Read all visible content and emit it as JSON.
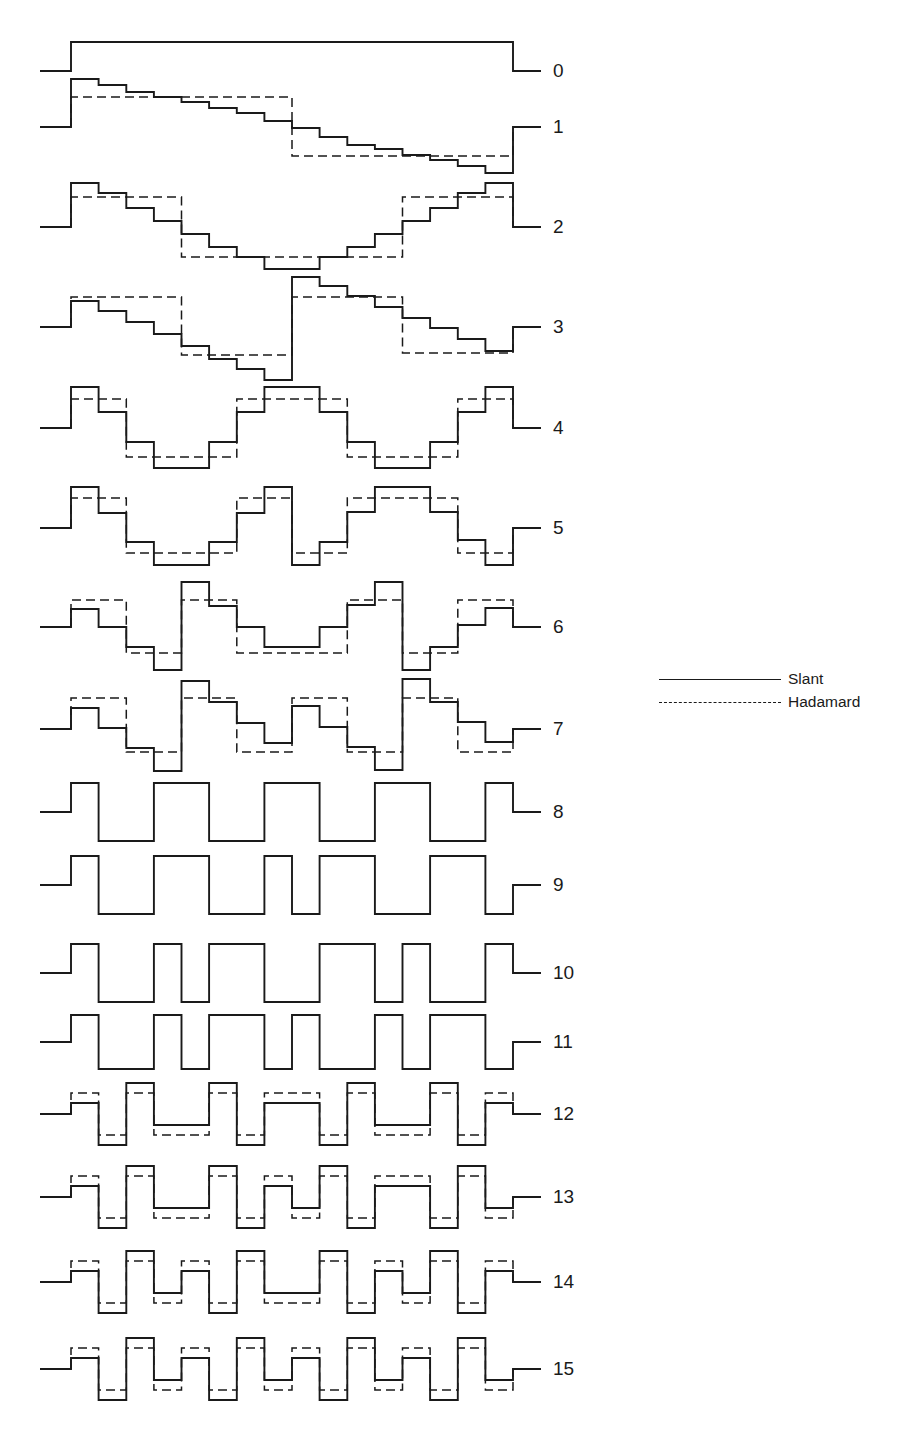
{
  "figure": {
    "x_start": 71,
    "x_end": 513,
    "lead_left_start": 40,
    "lead_right_end": 541,
    "label_x": 553,
    "n_steps": 16
  },
  "legend": {
    "items": [
      {
        "label": "Slant",
        "style": "solid"
      },
      {
        "label": "Hadamard",
        "style": "dashed"
      }
    ]
  },
  "chart_data": {
    "type": "step",
    "title": "",
    "xlabel": "",
    "ylabel": "",
    "legend": [
      "Slant",
      "Hadamard"
    ],
    "legend_position": "right",
    "grid": false,
    "units": "pixel offset above baseline (positive = up)",
    "rows": [
      {
        "label": "0",
        "baseline": 71,
        "slant": [
          29,
          29,
          29,
          29,
          29,
          29,
          29,
          29,
          29,
          29,
          29,
          29,
          29,
          29,
          29,
          29
        ],
        "hadamard": null
      },
      {
        "label": "1",
        "baseline": 127,
        "slant": [
          48,
          42,
          35,
          30,
          25,
          19,
          14,
          6,
          -1,
          -10,
          -18,
          -22,
          -28,
          -33,
          -39,
          -46
        ],
        "hadamard": [
          30,
          30,
          30,
          30,
          30,
          30,
          30,
          30,
          -29,
          -29,
          -29,
          -29,
          -29,
          -29,
          -29,
          -29
        ]
      },
      {
        "label": "2",
        "baseline": 227,
        "slant": [
          44,
          34,
          19,
          6,
          -7,
          -20,
          -30,
          -42,
          -42,
          -30,
          -20,
          -7,
          6,
          19,
          34,
          44
        ],
        "hadamard": [
          30,
          30,
          30,
          30,
          -30,
          -30,
          -30,
          -30,
          -30,
          -30,
          -30,
          -30,
          30,
          30,
          30,
          30
        ]
      },
      {
        "label": "3",
        "baseline": 327,
        "slant": [
          26,
          16,
          5,
          -7,
          -19,
          -32,
          -42,
          -53,
          50,
          41,
          31,
          20,
          9,
          -1,
          -12,
          -24
        ],
        "hadamard": [
          30,
          30,
          30,
          30,
          -28,
          -28,
          -28,
          -28,
          30,
          30,
          30,
          30,
          -26,
          -26,
          -26,
          -26
        ]
      },
      {
        "label": "4",
        "baseline": 428,
        "slant": [
          41,
          16,
          -14,
          -40,
          -40,
          -14,
          16,
          41,
          41,
          16,
          -14,
          -40,
          -40,
          -14,
          16,
          41
        ],
        "hadamard": [
          29,
          29,
          -29,
          -29,
          -29,
          -29,
          29,
          29,
          29,
          29,
          -29,
          -29,
          -29,
          -29,
          29,
          29
        ]
      },
      {
        "label": "5",
        "baseline": 528,
        "slant": [
          41,
          15,
          -14,
          -37,
          -37,
          -14,
          15,
          41,
          -37,
          -14,
          16,
          41,
          41,
          16,
          -12,
          -37
        ],
        "hadamard": [
          30,
          30,
          -25,
          -25,
          -25,
          -25,
          30,
          30,
          -25,
          -25,
          30,
          30,
          30,
          30,
          -25,
          -25
        ]
      },
      {
        "label": "6",
        "baseline": 627,
        "slant": [
          18,
          0,
          -20,
          -43,
          45,
          21,
          0,
          -20,
          -20,
          0,
          22,
          45,
          -43,
          -20,
          2,
          19
        ],
        "hadamard": [
          27,
          27,
          -26,
          -26,
          27,
          27,
          -26,
          -26,
          -26,
          -26,
          27,
          27,
          -26,
          -26,
          27,
          27
        ]
      },
      {
        "label": "7",
        "baseline": 729,
        "slant": [
          21,
          1,
          -19,
          -42,
          48,
          27,
          6,
          -14,
          23,
          2,
          -18,
          -41,
          50,
          27,
          7,
          -13
        ],
        "hadamard": [
          31,
          31,
          -23,
          -23,
          31,
          31,
          -23,
          -23,
          31,
          31,
          -23,
          -23,
          31,
          31,
          -23,
          -23
        ]
      },
      {
        "label": "8",
        "baseline": 812,
        "slant": [
          29,
          -29,
          -29,
          29,
          29,
          -29,
          -29,
          29,
          29,
          -29,
          -29,
          29,
          29,
          -29,
          -29,
          29
        ],
        "hadamard": null
      },
      {
        "label": "9",
        "baseline": 885,
        "slant": [
          29,
          -29,
          -29,
          29,
          29,
          -29,
          -29,
          29,
          -29,
          29,
          29,
          -29,
          -29,
          29,
          29,
          -29
        ],
        "hadamard": null
      },
      {
        "label": "10",
        "baseline": 973,
        "slant": [
          29,
          -29,
          -29,
          29,
          -29,
          29,
          29,
          -29,
          -29,
          29,
          29,
          -29,
          29,
          -29,
          -29,
          29
        ],
        "hadamard": null
      },
      {
        "label": "11",
        "baseline": 1042,
        "slant": [
          27,
          -27,
          -27,
          27,
          -27,
          27,
          27,
          -27,
          27,
          -27,
          -27,
          27,
          -27,
          27,
          27,
          -27
        ],
        "hadamard": null
      },
      {
        "label": "12",
        "baseline": 1114,
        "slant": [
          11,
          -31,
          31,
          -11,
          -11,
          31,
          -31,
          11,
          11,
          -31,
          31,
          -11,
          -11,
          31,
          -31,
          11
        ],
        "hadamard": [
          21,
          -21,
          21,
          -21,
          -21,
          21,
          -21,
          21,
          21,
          -21,
          21,
          -21,
          -21,
          21,
          -21,
          21
        ]
      },
      {
        "label": "13",
        "baseline": 1197,
        "slant": [
          11,
          -31,
          31,
          -11,
          -11,
          31,
          -31,
          11,
          -11,
          31,
          -31,
          11,
          11,
          -31,
          31,
          -11
        ],
        "hadamard": [
          21,
          -21,
          21,
          -21,
          -21,
          21,
          -21,
          21,
          -21,
          21,
          -21,
          21,
          21,
          -21,
          21,
          -21
        ]
      },
      {
        "label": "14",
        "baseline": 1282,
        "slant": [
          11,
          -31,
          31,
          -11,
          11,
          -31,
          31,
          -11,
          -11,
          31,
          -31,
          11,
          -11,
          31,
          -31,
          11
        ],
        "hadamard": [
          21,
          -21,
          21,
          -21,
          21,
          -21,
          21,
          -21,
          -21,
          21,
          -21,
          21,
          -21,
          21,
          -21,
          21
        ]
      },
      {
        "label": "15",
        "baseline": 1369,
        "slant": [
          11,
          -31,
          31,
          -11,
          11,
          -31,
          31,
          -11,
          11,
          -31,
          31,
          -11,
          11,
          -31,
          31,
          -11
        ],
        "hadamard": [
          21,
          -21,
          21,
          -21,
          21,
          -21,
          21,
          -21,
          21,
          -21,
          21,
          -21,
          21,
          -21,
          21,
          -21
        ]
      }
    ]
  }
}
